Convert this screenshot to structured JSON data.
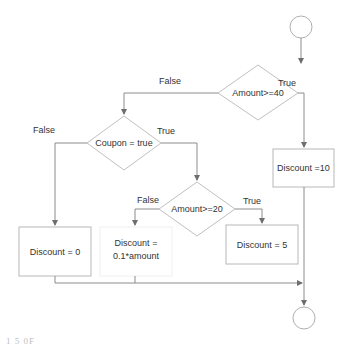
{
  "diagram": {
    "type": "flowchart",
    "colors": {
      "line": "#8c8c8c",
      "shape_border": "#b8b8b8",
      "text": "#333333",
      "background": "#ffffff"
    },
    "nodes": {
      "start": {
        "shape": "circle"
      },
      "d1": {
        "shape": "diamond",
        "label": "Amount>=40"
      },
      "d2": {
        "shape": "diamond",
        "label": "Coupon = true"
      },
      "d3": {
        "shape": "diamond",
        "label": "Amount>=20"
      },
      "b0": {
        "shape": "rect",
        "label": "Discount = 0"
      },
      "b01": {
        "shape": "rect",
        "label_line1": "Discount =",
        "label_line2": "0.1*amount"
      },
      "b5": {
        "shape": "rect",
        "label": "Discount = 5"
      },
      "b10": {
        "shape": "rect",
        "label": "Discount =10"
      },
      "end": {
        "shape": "circle"
      }
    },
    "edges": {
      "d1_false": "False",
      "d1_true": "True",
      "d2_false": "False",
      "d2_true": "True",
      "d3_false": "False",
      "d3_true": "True"
    },
    "caption_fragment": "1 5 0F"
  }
}
